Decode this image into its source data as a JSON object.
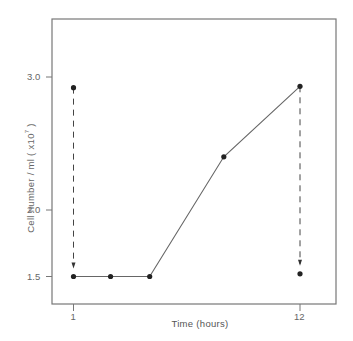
{
  "chart_data": {
    "type": "line",
    "title": "",
    "xlabel": "Time (hours)",
    "ylabel": "Cell number / ml (x10⁷)",
    "ylabel_main": "Cell number / ml ( x10",
    "ylabel_sup": "7",
    "ylabel_end": " )",
    "x_ticks": [
      {
        "value": 1,
        "label": "1"
      },
      {
        "value": 12,
        "label": "12"
      }
    ],
    "y_ticks": [
      {
        "value": 1.5,
        "label": "1.5"
      },
      {
        "value": 2.0,
        "label": "2.0"
      },
      {
        "value": 3.0,
        "label": "3.0"
      }
    ],
    "xlim": [
      0,
      13.1
    ],
    "ylim": [
      1.3,
      3.45
    ],
    "grid": false,
    "legend": null,
    "series": [
      {
        "name": "growth",
        "style": "solid",
        "points": [
          {
            "x": 1,
            "y": 1.5
          },
          {
            "x": 2.8,
            "y": 1.5
          },
          {
            "x": 4.7,
            "y": 1.5
          },
          {
            "x": 8.3,
            "y": 2.4
          },
          {
            "x": 12,
            "y": 2.93
          }
        ]
      }
    ],
    "dilutions": [
      {
        "name": "dilution-at-1h",
        "x": 1,
        "from": 2.92,
        "to": 1.5,
        "style": "dashed-arrow"
      },
      {
        "name": "dilution-at-12h",
        "x": 12,
        "from": 2.93,
        "to": 1.52,
        "style": "dashed-arrow"
      }
    ],
    "extra_points": [
      {
        "x": 1,
        "y": 2.92
      },
      {
        "x": 12,
        "y": 1.52
      }
    ]
  }
}
